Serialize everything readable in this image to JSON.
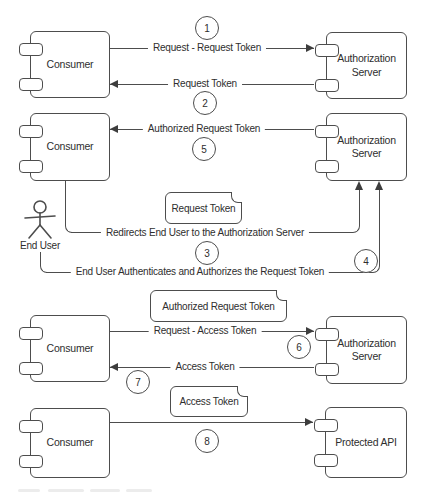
{
  "colors": {
    "stroke": "#4d4d4d",
    "text": "#2e2e2e",
    "background": "#ffffff"
  },
  "components": {
    "c1": {
      "label": "Consumer"
    },
    "a1": {
      "label": "Authorization Server"
    },
    "c2": {
      "label": "Consumer"
    },
    "a2": {
      "label": "Authorization Server"
    },
    "c3": {
      "label": "Consumer"
    },
    "a3": {
      "label": "Authorization Server"
    },
    "c4": {
      "label": "Consumer"
    },
    "api": {
      "label": "Protected API"
    }
  },
  "actor": {
    "label": "End User"
  },
  "notes": {
    "n1": {
      "label": "Request Token"
    },
    "n2": {
      "label": "Authorized Request Token"
    },
    "n3": {
      "label": "Access Token"
    }
  },
  "messages": {
    "m1": {
      "step": "1",
      "label": "Request - Request Token",
      "from": "Consumer",
      "to": "Authorization Server"
    },
    "m2": {
      "step": "2",
      "label": "Request Token",
      "from": "Authorization Server",
      "to": "Consumer"
    },
    "m5": {
      "step": "5",
      "label": "Authorized Request Token",
      "from": "Authorization Server",
      "to": "Consumer"
    },
    "m3": {
      "step": "3",
      "label": "Redirects End User to the Authorization Server",
      "from": "Consumer",
      "to": "Authorization Server"
    },
    "m4": {
      "step": "4",
      "label": "End User Authenticates and Authorizes the Request Token",
      "from": "End User",
      "to": "Authorization Server"
    },
    "m6": {
      "step": "6",
      "label": "Request - Access Token",
      "from": "Consumer",
      "to": "Authorization Server"
    },
    "m7": {
      "step": "7",
      "label": "Access Token",
      "from": "Authorization Server",
      "to": "Consumer"
    },
    "m8": {
      "step": "8",
      "label": "",
      "from": "Consumer",
      "to": "Protected API"
    }
  }
}
